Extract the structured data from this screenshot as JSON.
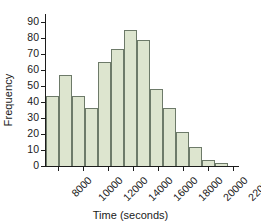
{
  "chart_data": {
    "type": "bar",
    "title": "",
    "xlabel": "Time (seconds)",
    "ylabel": "Frequency",
    "grid": false,
    "legend": null,
    "bin_width": 1000,
    "xlim": [
      7000,
      22500
    ],
    "ylim": [
      0,
      95
    ],
    "yticks": [
      0,
      10,
      20,
      30,
      40,
      50,
      60,
      70,
      80,
      90
    ],
    "ytick_labels": [
      "0",
      "10",
      "20",
      "30",
      "40",
      "50",
      "60",
      "70",
      "80",
      "90"
    ],
    "xticks": [
      8000,
      10000,
      12000,
      14000,
      16000,
      18000,
      20000,
      22000
    ],
    "xtick_labels": [
      "8000",
      "10000",
      "12000",
      "14000",
      "16000",
      "18000",
      "20000",
      "22000"
    ],
    "bin_starts": [
      7500,
      8500,
      9500,
      10500,
      11500,
      12500,
      13500,
      14500,
      15500,
      16500,
      17500,
      18500,
      19500,
      20500,
      21500
    ],
    "categories": [
      "7500-8500",
      "8500-9500",
      "9500-10500",
      "10500-11500",
      "11500-12500",
      "12500-13500",
      "13500-14500",
      "14500-15500",
      "15500-16500",
      "16500-17500",
      "17500-18500",
      "18500-19500",
      "19500-20500",
      "20500-21500",
      "21500-22500"
    ],
    "values": [
      44,
      57,
      44,
      36,
      65,
      73,
      85,
      79,
      48,
      36,
      21,
      12,
      4,
      2,
      0
    ],
    "colors": {
      "bar_fill": "#dde5cf",
      "bar_edge": "#6d7a69",
      "axis": "#1c1c1c",
      "text": "#1a1a1a",
      "background": "#ffffff"
    }
  }
}
